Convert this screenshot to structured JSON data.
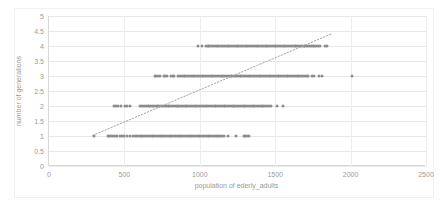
{
  "chart_data": {
    "type": "scatter",
    "title": "",
    "xlabel": "population of ederly_adults",
    "ylabel": "number of generations",
    "xlim": [
      0,
      2500
    ],
    "ylim": [
      0,
      5
    ],
    "xticks": [
      0,
      500,
      1000,
      1500,
      2000,
      2500
    ],
    "yticks": [
      0,
      0.5,
      1,
      1.5,
      2,
      2.5,
      3,
      3.5,
      4,
      4.5,
      5
    ],
    "grid": true,
    "legend": false,
    "marker_color": "#8c8c8c",
    "marker_size": 3,
    "trendline": {
      "visible": true,
      "style": "dotted",
      "color": "#a6a6a6",
      "x_start": 290,
      "y_start": 1.02,
      "x_end": 1880,
      "y_end": 4.42
    },
    "series": [
      {
        "name": "generations vs elderly population",
        "x": [
          300,
          390,
          400,
          412,
          424,
          436,
          448,
          472,
          484,
          496,
          520,
          540,
          560,
          572,
          584,
          596,
          608,
          620,
          632,
          644,
          656,
          668,
          680,
          692,
          704,
          716,
          728,
          740,
          752,
          764,
          776,
          788,
          800,
          812,
          824,
          836,
          848,
          860,
          872,
          884,
          896,
          908,
          920,
          932,
          944,
          956,
          968,
          980,
          992,
          1004,
          1016,
          1028,
          1040,
          1052,
          1064,
          1076,
          1088,
          1100,
          1112,
          1124,
          1136,
          1148,
          1160,
          1185,
          1240,
          1290,
          1300,
          1312,
          1324,
          430,
          445,
          460,
          475,
          505,
          520,
          535,
          605,
          618,
          630,
          642,
          654,
          666,
          678,
          690,
          702,
          714,
          726,
          738,
          750,
          762,
          774,
          786,
          798,
          810,
          822,
          834,
          846,
          858,
          870,
          882,
          894,
          906,
          918,
          930,
          942,
          954,
          966,
          978,
          990,
          1002,
          1014,
          1026,
          1038,
          1050,
          1062,
          1074,
          1086,
          1098,
          1110,
          1122,
          1134,
          1146,
          1158,
          1170,
          1182,
          1194,
          1206,
          1218,
          1230,
          1242,
          1254,
          1266,
          1278,
          1290,
          1302,
          1314,
          1326,
          1338,
          1350,
          1362,
          1374,
          1386,
          1398,
          1410,
          1422,
          1434,
          1446,
          1458,
          1470,
          1510,
          1555,
          700,
          712,
          724,
          736,
          760,
          772,
          784,
          808,
          820,
          832,
          856,
          868,
          880,
          892,
          904,
          916,
          928,
          940,
          952,
          964,
          976,
          988,
          1000,
          1012,
          1024,
          1036,
          1048,
          1060,
          1072,
          1084,
          1096,
          1108,
          1120,
          1132,
          1144,
          1156,
          1168,
          1180,
          1192,
          1204,
          1216,
          1228,
          1240,
          1252,
          1264,
          1276,
          1288,
          1300,
          1312,
          1324,
          1336,
          1348,
          1360,
          1372,
          1384,
          1396,
          1408,
          1420,
          1432,
          1444,
          1456,
          1468,
          1480,
          1492,
          1504,
          1516,
          1528,
          1540,
          1552,
          1564,
          1576,
          1588,
          1600,
          1612,
          1624,
          1636,
          1648,
          1660,
          1672,
          1684,
          1696,
          1708,
          1720,
          1745,
          1760,
          1790,
          1810,
          2010,
          985,
          1015,
          1040,
          1052,
          1064,
          1076,
          1088,
          1100,
          1112,
          1124,
          1136,
          1148,
          1160,
          1172,
          1184,
          1196,
          1208,
          1220,
          1232,
          1244,
          1256,
          1268,
          1280,
          1292,
          1304,
          1316,
          1328,
          1340,
          1352,
          1364,
          1376,
          1388,
          1400,
          1412,
          1424,
          1436,
          1448,
          1460,
          1472,
          1484,
          1496,
          1508,
          1520,
          1532,
          1544,
          1556,
          1568,
          1580,
          1592,
          1604,
          1616,
          1628,
          1640,
          1652,
          1664,
          1676,
          1688,
          1700,
          1712,
          1724,
          1736,
          1748,
          1760,
          1772,
          1784,
          1800,
          1830,
          1845
        ],
        "y": [
          1,
          1,
          1,
          1,
          1,
          1,
          1,
          1,
          1,
          1,
          1,
          1,
          1,
          1,
          1,
          1,
          1,
          1,
          1,
          1,
          1,
          1,
          1,
          1,
          1,
          1,
          1,
          1,
          1,
          1,
          1,
          1,
          1,
          1,
          1,
          1,
          1,
          1,
          1,
          1,
          1,
          1,
          1,
          1,
          1,
          1,
          1,
          1,
          1,
          1,
          1,
          1,
          1,
          1,
          1,
          1,
          1,
          1,
          1,
          1,
          1,
          1,
          1,
          1,
          1,
          1,
          1,
          1,
          1,
          2,
          2,
          2,
          2,
          2,
          2,
          2,
          2,
          2,
          2,
          2,
          2,
          2,
          2,
          2,
          2,
          2,
          2,
          2,
          2,
          2,
          2,
          2,
          2,
          2,
          2,
          2,
          2,
          2,
          2,
          2,
          2,
          2,
          2,
          2,
          2,
          2,
          2,
          2,
          2,
          2,
          2,
          2,
          2,
          2,
          2,
          2,
          2,
          2,
          2,
          2,
          2,
          2,
          2,
          2,
          2,
          2,
          2,
          2,
          2,
          2,
          2,
          2,
          2,
          2,
          2,
          2,
          2,
          2,
          2,
          2,
          2,
          2,
          2,
          2,
          2,
          2,
          2,
          2,
          2,
          2,
          2,
          3,
          3,
          3,
          3,
          3,
          3,
          3,
          3,
          3,
          3,
          3,
          3,
          3,
          3,
          3,
          3,
          3,
          3,
          3,
          3,
          3,
          3,
          3,
          3,
          3,
          3,
          3,
          3,
          3,
          3,
          3,
          3,
          3,
          3,
          3,
          3,
          3,
          3,
          3,
          3,
          3,
          3,
          3,
          3,
          3,
          3,
          3,
          3,
          3,
          3,
          3,
          3,
          3,
          3,
          3,
          3,
          3,
          3,
          3,
          3,
          3,
          3,
          3,
          3,
          3,
          3,
          3,
          3,
          3,
          3,
          3,
          3,
          3,
          3,
          3,
          3,
          3,
          3,
          3,
          3,
          3,
          3,
          3,
          3,
          3,
          3,
          3,
          3,
          4,
          4,
          4,
          4,
          4,
          4,
          4,
          4,
          4,
          4,
          4,
          4,
          4,
          4,
          4,
          4,
          4,
          4,
          4,
          4,
          4,
          4,
          4,
          4,
          4,
          4,
          4,
          4,
          4,
          4,
          4,
          4,
          4,
          4,
          4,
          4,
          4,
          4,
          4,
          4,
          4,
          4,
          4,
          4,
          4,
          4,
          4,
          4,
          4,
          4,
          4,
          4,
          4,
          4,
          4,
          4,
          4,
          4,
          4,
          4,
          4,
          4,
          4,
          4,
          4,
          4,
          4,
          4
        ]
      }
    ]
  }
}
